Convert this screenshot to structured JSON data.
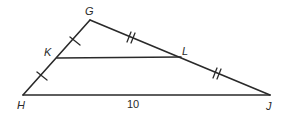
{
  "diagram": {
    "type": "triangle-midsegment",
    "points": {
      "G": {
        "x": 90,
        "y": 20
      },
      "H": {
        "x": 23,
        "y": 95
      },
      "J": {
        "x": 270,
        "y": 95
      },
      "K": {
        "x": 57,
        "y": 58
      },
      "L": {
        "x": 181,
        "y": 57
      }
    },
    "labels": {
      "G": "G",
      "H": "H",
      "J": "J",
      "K": "K",
      "L": "L"
    },
    "segments": [
      {
        "from": "G",
        "to": "H",
        "name": "side-GH"
      },
      {
        "from": "G",
        "to": "J",
        "name": "side-GJ"
      },
      {
        "from": "H",
        "to": "J",
        "name": "side-HJ"
      },
      {
        "from": "K",
        "to": "L",
        "name": "midsegment-KL"
      }
    ],
    "measurements": {
      "HJ": "10"
    },
    "congruence_marks": {
      "single_tick": [
        "GK",
        "KH"
      ],
      "double_tick": [
        "GL",
        "LJ"
      ]
    },
    "stroke_color": "#2a2a2a",
    "background_color": "#ffffff"
  }
}
